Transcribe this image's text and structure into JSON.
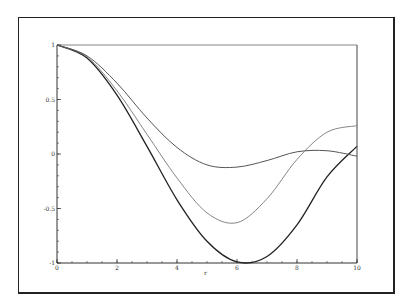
{
  "chart_data": {
    "type": "line",
    "title": "",
    "xlabel": "r",
    "ylabel": "",
    "xlim": [
      0,
      10
    ],
    "ylim": [
      -1,
      1
    ],
    "grid": false,
    "legend": null,
    "x_ticks": [
      "0",
      "2",
      "4",
      "6",
      "8",
      "10"
    ],
    "y_ticks": [
      "1",
      "0.5",
      "0",
      "-0.5",
      "-1"
    ],
    "x": [
      0,
      1,
      2,
      3,
      4,
      5,
      6,
      7,
      8,
      9,
      10
    ],
    "series": [
      {
        "name": "curve-1",
        "style": "solid-dark",
        "color": "#222222",
        "values": [
          1,
          0.88,
          0.54,
          0.07,
          -0.42,
          -0.8,
          -0.99,
          -0.94,
          -0.65,
          -0.21,
          0.07
        ]
      },
      {
        "name": "curve-2",
        "style": "light",
        "color": "#777777",
        "values": [
          1,
          0.89,
          0.58,
          0.18,
          -0.22,
          -0.54,
          -0.63,
          -0.41,
          -0.05,
          0.2,
          0.26
        ]
      },
      {
        "name": "curve-3",
        "style": "medium",
        "color": "#555555",
        "values": [
          1,
          0.9,
          0.65,
          0.33,
          0.06,
          -0.1,
          -0.12,
          -0.06,
          0.02,
          0.03,
          -0.02
        ]
      }
    ]
  }
}
